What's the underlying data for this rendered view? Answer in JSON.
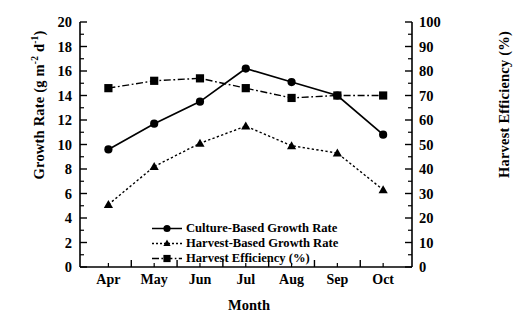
{
  "chart_data": {
    "type": "line",
    "title": "",
    "xlabel": "Month",
    "ylabel": "Growth Rate (g m-2 d-1)",
    "ylabel_right": "Harvest Efficiency (%)",
    "categories": [
      "Apr",
      "May",
      "Jun",
      "Jul",
      "Aug",
      "Sep",
      "Oct"
    ],
    "ylim": [
      0,
      20
    ],
    "yticks": [
      0,
      2,
      4,
      6,
      8,
      10,
      12,
      14,
      16,
      18,
      20
    ],
    "ylim_right": [
      0,
      100
    ],
    "yticks_right": [
      0,
      10,
      20,
      30,
      40,
      50,
      60,
      70,
      80,
      90,
      100
    ],
    "grid": false,
    "legend_position": "inside-bottom-center",
    "series": [
      {
        "name": "Culture-Based Growth Rate",
        "axis": "left",
        "marker": "circle",
        "linestyle": "solid",
        "values": [
          9.6,
          11.7,
          13.5,
          16.2,
          15.1,
          14.0,
          10.8
        ]
      },
      {
        "name": "Harvest-Based Growth Rate",
        "axis": "left",
        "marker": "triangle",
        "linestyle": "dotted",
        "values": [
          5.1,
          8.2,
          10.1,
          11.5,
          9.9,
          9.3,
          6.3
        ]
      },
      {
        "name": "Harvest Efficiency (%)",
        "axis": "right",
        "marker": "square",
        "linestyle": "dashdot",
        "values": [
          73,
          76,
          77,
          73,
          69,
          70,
          70
        ]
      }
    ]
  },
  "axes": {
    "left_title_main": "Growth Rate (g m",
    "left_title_sup1": "-2",
    "left_title_mid": " d",
    "left_title_sup2": "-1",
    "left_title_end": ")",
    "right_title": "Harvest Efficiency (%)",
    "x_title": "Month"
  },
  "colors": {
    "axis": "#000000",
    "series_culture": "#000000",
    "series_harvest": "#000000",
    "series_efficiency": "#000000",
    "background": "#ffffff"
  }
}
